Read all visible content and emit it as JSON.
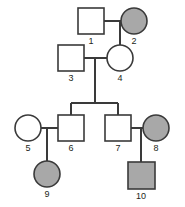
{
  "diagram": {
    "kind": "pedigree-chart",
    "title": "",
    "colors": {
      "stroke": "#3a3a3a",
      "affected_fill": "#a8a8a8",
      "unaffected_fill": "#ffffff",
      "background": "#ffffff",
      "label_color": "#231f20"
    },
    "legend_note": "",
    "generations": 4,
    "individuals": [
      {
        "id": "1",
        "label": "1",
        "sex": "male",
        "shape": "square",
        "affected": false,
        "generation": 1,
        "cx": 91,
        "cy": 21,
        "size": 26
      },
      {
        "id": "2",
        "label": "2",
        "sex": "female",
        "shape": "circle",
        "affected": true,
        "generation": 1,
        "cx": 134,
        "cy": 21,
        "size": 26
      },
      {
        "id": "3",
        "label": "3",
        "sex": "male",
        "shape": "square",
        "affected": false,
        "generation": 2,
        "cx": 71,
        "cy": 58,
        "size": 26
      },
      {
        "id": "4",
        "label": "4",
        "sex": "female",
        "shape": "circle",
        "affected": false,
        "generation": 2,
        "cx": 120,
        "cy": 58,
        "size": 26
      },
      {
        "id": "5",
        "label": "5",
        "sex": "female",
        "shape": "circle",
        "affected": false,
        "generation": 3,
        "cx": 28,
        "cy": 128,
        "size": 26
      },
      {
        "id": "6",
        "label": "6",
        "sex": "male",
        "shape": "square",
        "affected": false,
        "generation": 3,
        "cx": 71,
        "cy": 128,
        "size": 26
      },
      {
        "id": "7",
        "label": "7",
        "sex": "male",
        "shape": "square",
        "affected": false,
        "generation": 3,
        "cx": 118,
        "cy": 128,
        "size": 26
      },
      {
        "id": "8",
        "label": "8",
        "sex": "female",
        "shape": "circle",
        "affected": true,
        "generation": 3,
        "cx": 156,
        "cy": 128,
        "size": 26
      },
      {
        "id": "9",
        "label": "9",
        "sex": "female",
        "shape": "circle",
        "affected": true,
        "generation": 4,
        "cx": 47,
        "cy": 174,
        "size": 26
      },
      {
        "id": "10",
        "label": "10",
        "sex": "male",
        "shape": "square",
        "affected": true,
        "generation": 4,
        "cx": 141,
        "cy": 175,
        "size": 27
      }
    ],
    "matings": [
      {
        "id": "m1",
        "partners": [
          "1",
          "2"
        ],
        "children": [
          "4"
        ]
      },
      {
        "id": "m2",
        "partners": [
          "3",
          "4"
        ],
        "children": [
          "6",
          "7"
        ]
      },
      {
        "id": "m3",
        "partners": [
          "5",
          "6"
        ],
        "children": [
          "9"
        ]
      },
      {
        "id": "m4",
        "partners": [
          "7",
          "8"
        ],
        "children": [
          "10"
        ]
      }
    ]
  }
}
